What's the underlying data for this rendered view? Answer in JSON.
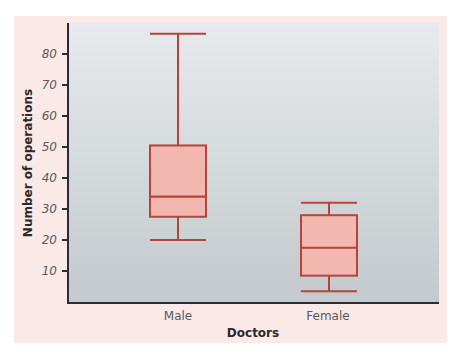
{
  "chart_data": {
    "type": "boxplot",
    "title": "",
    "xlabel": "Doctors",
    "ylabel": "Number of operations",
    "categories": [
      "Male",
      "Female"
    ],
    "ylim": [
      0,
      90
    ],
    "yticks": [
      10,
      20,
      30,
      40,
      50,
      60,
      70,
      80
    ],
    "grid": false,
    "legend": null,
    "series": [
      {
        "name": "Male",
        "min": 20,
        "q1": 27.5,
        "median": 34,
        "q3": 50.5,
        "max": 86.5
      },
      {
        "name": "Female",
        "min": 3.5,
        "q1": 8.5,
        "median": 17.5,
        "q3": 28,
        "max": 32
      }
    ],
    "colors": {
      "box_fill": "#f2b8b0",
      "box_stroke": "#b5443a",
      "plot_bg_top": "#e4e8ea",
      "plot_bg_bottom": "#c4cacd",
      "frame_bg": "#fbe9e8",
      "axis": "#2b2b35"
    }
  },
  "labels": {
    "yaxis_title": "Number of operations",
    "xaxis_title": "Doctors",
    "categories": [
      "Male",
      "Female"
    ],
    "yticks": [
      "10",
      "20",
      "30",
      "40",
      "50",
      "60",
      "70",
      "80"
    ]
  }
}
